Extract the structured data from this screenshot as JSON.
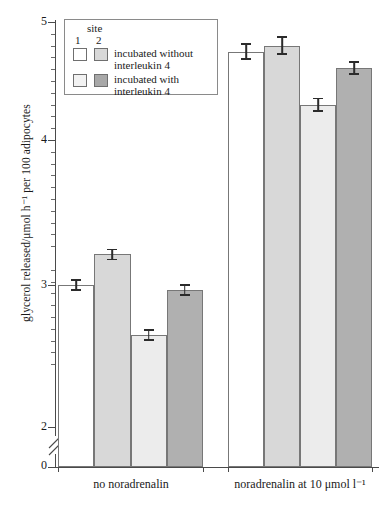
{
  "chart_data": {
    "type": "bar",
    "title": "",
    "xlabel": "",
    "ylabel": "glycerol released/μmol h⁻¹ per 100 adipocytes",
    "ylim": [
      2.0,
      5.0
    ],
    "y_axis_break": true,
    "y_break_between": [
      0,
      2
    ],
    "y_tick_labels": [
      "5",
      "4",
      "3",
      "2",
      "0"
    ],
    "y_tick_values": [
      5,
      4,
      3,
      2,
      0
    ],
    "y_minor_tick_step": 0.1,
    "grid": false,
    "legend_position": "top-left",
    "categories": [
      "no noradrenalin",
      "noradrenalin at 10 μmol l⁻¹"
    ],
    "series": [
      {
        "name": "site 1, incubated without interleukin 4",
        "color": "#ffffff",
        "values": [
          2.77,
          4.75
        ],
        "errors": [
          0.05,
          0.07
        ]
      },
      {
        "name": "site 2, incubated without interleukin 4",
        "color": "#d8d8d8",
        "values": [
          3.03,
          4.8
        ],
        "errors": [
          0.05,
          0.08
        ]
      },
      {
        "name": "site 1, incubated with interleukin 4",
        "color": "#ececec",
        "values": [
          2.35,
          4.3
        ],
        "errors": [
          0.05,
          0.06
        ]
      },
      {
        "name": "site 2, incubated with interleukin 4",
        "color": "#b0b0b0",
        "values": [
          2.73,
          4.61
        ],
        "errors": [
          0.05,
          0.06
        ]
      }
    ]
  },
  "legend": {
    "site_header": "site",
    "col1": "1",
    "col2": "2",
    "row1_text_line1": "incubated without",
    "row1_text_line2": "interleukin 4",
    "row2_text_line1": "incubated with",
    "row2_text_line2": "interleukin 4",
    "swatch_colors": {
      "row1_site1": "#ffffff",
      "row1_site2": "#d8d8d8",
      "row2_site1": "#f2f2f2",
      "row2_site2": "#a8a8a8"
    }
  },
  "axis": {
    "y_label": "glycerol released/μmol h⁻¹ per 100 adipocytes",
    "tick_5": "5",
    "tick_4": "4",
    "tick_3": "3",
    "tick_2": "2",
    "tick_0": "0",
    "group_1_label": "no noradrenalin",
    "group_2_label": "noradrenalin at 10 μmol l⁻¹"
  }
}
